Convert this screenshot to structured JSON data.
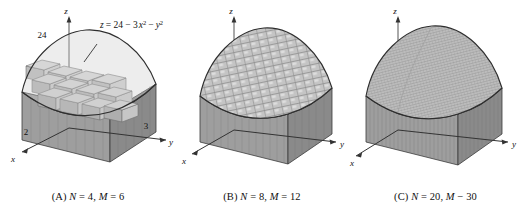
{
  "figure": {
    "equation_label": {
      "z": "z",
      "eq": "= 24 − 3",
      "x": "x",
      "sup2a": "2",
      "minus": "−",
      "y": "y",
      "sup2b": "2"
    },
    "panels": [
      {
        "id": "A",
        "caption": "(A) N = 4, M = 6",
        "caption_prefix": "(A) ",
        "caption_n_label": "N",
        "caption_n_eq": " = 4, ",
        "caption_m_label": "M",
        "caption_m_eq": " = 6",
        "N": 4,
        "M": 6,
        "axes": {
          "x": "x",
          "y": "y",
          "z": "z"
        },
        "ticks": {
          "x": "2",
          "y": "3",
          "z": "24"
        },
        "has_equation_label": true,
        "has_tick_labels": true
      },
      {
        "id": "B",
        "caption": "(B) N = 8, M = 12",
        "caption_prefix": "(B) ",
        "caption_n_label": "N",
        "caption_n_eq": " = 8, ",
        "caption_m_label": "M",
        "caption_m_eq": " = 12",
        "N": 8,
        "M": 12,
        "axes": {
          "x": "x",
          "y": "y",
          "z": "z"
        },
        "ticks": {
          "x": "",
          "y": "",
          "z": ""
        },
        "has_equation_label": false,
        "has_tick_labels": false
      },
      {
        "id": "C",
        "caption": "(C) N = 20, M − 30",
        "caption_prefix": "(C) ",
        "caption_n_label": "N",
        "caption_n_eq": " = 20, ",
        "caption_m_label": "M",
        "caption_m_eq": " − 30",
        "N": 20,
        "M": 30,
        "axes": {
          "x": "x",
          "y": "y",
          "z": "z"
        },
        "ticks": {
          "x": "",
          "y": "",
          "z": ""
        },
        "has_equation_label": false,
        "has_tick_labels": false
      }
    ],
    "surface": {
      "formula": "z = 24 - 3x^2 - y^2",
      "z_intercept": 24,
      "x_extent": 2,
      "y_extent": 3
    },
    "colors": {
      "background": "#ffffff",
      "ink": "#1a1a1a",
      "body_fill": "#a8a8a8",
      "body_fill_dark": "#8e8e8e",
      "top_fill": "#c9c9c9",
      "top_fill_light": "#d8d8d8",
      "side_fill": "#9a9a9a",
      "outline": "#3a3a3a",
      "mesh_line": "#787878"
    }
  }
}
